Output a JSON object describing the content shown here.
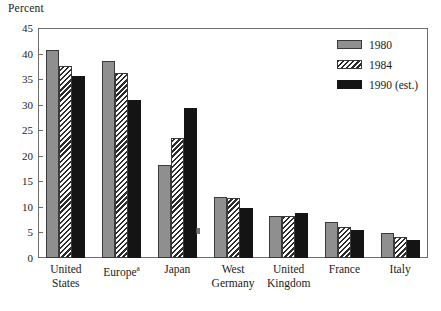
{
  "chart_data": {
    "type": "bar",
    "title": "",
    "subtitle": "",
    "xlabel": "",
    "ylabel": "Percent",
    "ylim": [
      0,
      45
    ],
    "ytick_step": 5,
    "yticks": [
      45,
      40,
      35,
      30,
      25,
      20,
      15,
      10,
      5,
      0
    ],
    "grid": false,
    "legend_position": "top-right",
    "categories": [
      "United States",
      "Europe",
      "Japan",
      "West Germany",
      "United Kingdom",
      "France",
      "Italy"
    ],
    "category_labels": [
      [
        "United",
        "States"
      ],
      [
        "Europe",
        ""
      ],
      [
        "Japan",
        ""
      ],
      [
        "West",
        "Germany"
      ],
      [
        "United",
        "Kingdom"
      ],
      [
        "France",
        ""
      ],
      [
        "Italy",
        ""
      ]
    ],
    "category_footnotes": [
      "",
      "a",
      "",
      "",
      "",
      "",
      ""
    ],
    "series": [
      {
        "name": "1980",
        "values": [
          40.7,
          38.6,
          18.2,
          12.0,
          8.3,
          7.0,
          4.8
        ],
        "color": "#8f8f8f",
        "pattern": "solid-gray"
      },
      {
        "name": "1984",
        "values": [
          37.5,
          36.2,
          23.5,
          11.8,
          8.3,
          6.1,
          4.1
        ],
        "color": "#ffffff",
        "pattern": "diagonal-hatch"
      },
      {
        "name": "1990 (est.)",
        "values": [
          35.7,
          31.0,
          29.3,
          9.8,
          8.9,
          5.5,
          3.5
        ],
        "color": "#141414",
        "pattern": "solid-black"
      }
    ]
  },
  "legend": {
    "items": [
      {
        "label": "1980"
      },
      {
        "label": "1984"
      },
      {
        "label": "1990 (est.)"
      }
    ]
  },
  "axis": {
    "y_unit_label": "Percent"
  },
  "colors": {
    "series_1980": "#8f8f8f",
    "series_1984_hatch": "#2b2b2b",
    "series_1990": "#141414",
    "frame": "#6d6d6d",
    "text": "#1a1a1a",
    "background": "#ffffff"
  }
}
